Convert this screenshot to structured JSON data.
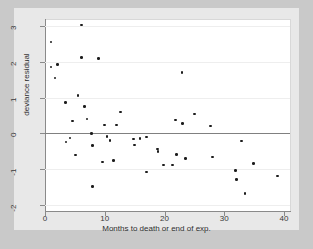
{
  "figure": {
    "background_color": "#e8e8e8",
    "page_background_color": "#c9c9c9",
    "plot_background_color": "#ffffff",
    "marker_color": "#1c1c1c",
    "gridline_color": "#eeeeee",
    "zeroline_color": "#808080",
    "axis_color": "#8a8a8a"
  },
  "chart_data": {
    "type": "scatter",
    "title": "",
    "xlabel": "Months to death or end of exp.",
    "ylabel": "deviance residual",
    "xlim": [
      0,
      41
    ],
    "ylim": [
      -2.15,
      3.2
    ],
    "xticks": [
      0,
      10,
      20,
      30,
      40
    ],
    "xtick_labels": [
      "0",
      "10",
      "20",
      "30",
      "40"
    ],
    "yticks": [
      3,
      2,
      1,
      0,
      -1,
      -2
    ],
    "ytick_labels": [
      "3",
      "2",
      "1",
      "0",
      "-1",
      "-2"
    ],
    "grid": true,
    "grid_axis": "y",
    "legend": null,
    "reference_line": {
      "y": 0,
      "color": "#808080"
    },
    "series": [
      {
        "name": "deviance residuals",
        "marker": "circle",
        "color": "#1c1c1c",
        "points": [
          [
            1.0,
            2.56
          ],
          [
            1.0,
            1.86
          ],
          [
            1.7,
            1.55
          ],
          [
            2.1,
            1.92
          ],
          [
            3.4,
            0.86
          ],
          [
            3.5,
            -0.25
          ],
          [
            4.2,
            -0.13
          ],
          [
            4.6,
            0.34
          ],
          [
            5.1,
            -0.61
          ],
          [
            5.5,
            1.05
          ],
          [
            6.1,
            3.03
          ],
          [
            6.1,
            2.12
          ],
          [
            6.6,
            0.75
          ],
          [
            7.0,
            0.4
          ],
          [
            7.8,
            0.0
          ],
          [
            7.9,
            -0.34
          ],
          [
            7.9,
            -1.5
          ],
          [
            9.0,
            2.1
          ],
          [
            9.6,
            -0.81
          ],
          [
            10.0,
            0.23
          ],
          [
            10.4,
            -0.09
          ],
          [
            10.9,
            -0.2
          ],
          [
            11.5,
            -0.77
          ],
          [
            12.0,
            0.23
          ],
          [
            12.6,
            0.6
          ],
          [
            14.8,
            -0.16
          ],
          [
            15.0,
            -0.33
          ],
          [
            15.9,
            -0.14
          ],
          [
            17.0,
            -0.11
          ],
          [
            17.0,
            -1.08
          ],
          [
            18.8,
            -0.44
          ],
          [
            18.9,
            -0.51
          ],
          [
            19.8,
            -0.89
          ],
          [
            21.3,
            -0.89
          ],
          [
            21.8,
            0.37
          ],
          [
            22.0,
            -0.59
          ],
          [
            22.9,
            1.7
          ],
          [
            23.0,
            0.27
          ],
          [
            23.5,
            -0.71
          ],
          [
            25.0,
            0.54
          ],
          [
            27.7,
            0.2
          ],
          [
            28.0,
            -0.67
          ],
          [
            31.9,
            -1.05
          ],
          [
            32.0,
            -1.29
          ],
          [
            32.9,
            -0.22
          ],
          [
            33.5,
            -1.69
          ],
          [
            34.9,
            -0.85
          ],
          [
            38.9,
            -1.2
          ]
        ]
      }
    ]
  }
}
